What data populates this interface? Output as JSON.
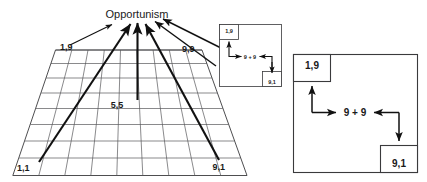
{
  "figure": {
    "title": "Opportunism",
    "grid": {
      "corner_labels": {
        "top_left": "1,9",
        "top_right": "9,9",
        "bottom_left": "1,1",
        "bottom_right": "9,1",
        "center": "5,5"
      },
      "columns": 9,
      "rows": 9
    },
    "inset_box": {
      "top_left_label": "1,9",
      "center_label": "9 + 9",
      "bottom_right_label": "9,1"
    },
    "main_box": {
      "top_left_label": "1,9",
      "center_label": "9 + 9",
      "bottom_right_label": "9,1"
    },
    "colors": {
      "ink": "#111111",
      "grid": "#58585a",
      "frame": "#3a3a3c",
      "background": "#ffffff"
    }
  }
}
